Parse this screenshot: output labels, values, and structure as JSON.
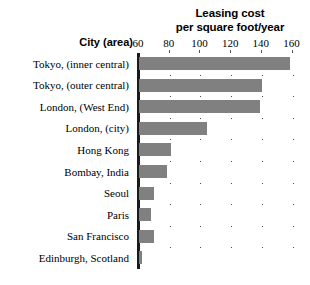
{
  "chart_data": {
    "type": "bar",
    "orientation": "horizontal",
    "title": "Leasing cost per square foot/year",
    "title_lines": [
      "Leasing cost",
      "per square foot/year"
    ],
    "xlabel": "",
    "ylabel": "City (area)",
    "categories": [
      "Tokyo, (inner central)",
      "Tokyo, (outer central)",
      "London, (West End)",
      "London, (city)",
      "Hong Kong",
      "Bombay, India",
      "Seoul",
      "Paris",
      "San Francisco",
      "Edinburgh, Scotland"
    ],
    "values": [
      158,
      140,
      139,
      104,
      81,
      78,
      70,
      68,
      70,
      62
    ],
    "xlim": [
      60,
      172
    ],
    "xticks": [
      60,
      80,
      100,
      120,
      140,
      160
    ],
    "xtick_labels": [
      "60",
      "80",
      "100",
      "120",
      "140",
      "160"
    ],
    "grid": "dotted",
    "legend": "none",
    "bar_color": "#808080",
    "axis_color": "#1a1a1a",
    "background": "#ffffff"
  },
  "axis": {
    "y_header": "City (area)"
  }
}
